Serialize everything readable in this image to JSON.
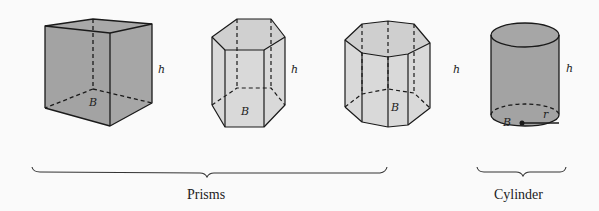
{
  "figure": {
    "shapes": [
      {
        "id": "cube",
        "kind": "rectangular-prism",
        "group": "prisms",
        "base_label": "B",
        "height_label": "h"
      },
      {
        "id": "hexagonal-prism",
        "kind": "hexagonal-prism",
        "group": "prisms",
        "base_label": "B",
        "height_label": "h"
      },
      {
        "id": "octagonal-prism",
        "kind": "octagonal-prism",
        "group": "prisms",
        "base_label": "B",
        "height_label": "h"
      },
      {
        "id": "cylinder",
        "kind": "cylinder",
        "group": "cylinder",
        "base_label": "B",
        "height_label": "h",
        "radius_label": "r"
      }
    ],
    "groups": [
      {
        "id": "prisms",
        "label": "Prisms"
      },
      {
        "id": "cylinder",
        "label": "Cylinder"
      }
    ],
    "colors": {
      "background": "#fafafa",
      "dark_fill": "#a3a3a3",
      "light_fill": "#d6d6d6",
      "stroke": "#1a1a1a"
    }
  }
}
